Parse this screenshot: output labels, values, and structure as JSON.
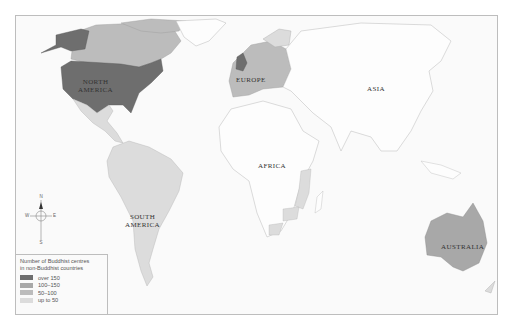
{
  "map": {
    "title": "Number of Buddhist centres in non-Buddhist countries",
    "regions": [
      {
        "name": "NORTH AMERICA",
        "label_lines": [
          "NORTH",
          "AMERICA"
        ]
      },
      {
        "name": "EUROPE",
        "label_lines": [
          "EUROPE"
        ]
      },
      {
        "name": "ASIA",
        "label_lines": [
          "ASIA"
        ]
      },
      {
        "name": "AFRICA",
        "label_lines": [
          "AFRICA"
        ]
      },
      {
        "name": "SOUTH AMERICA",
        "label_lines": [
          "SOUTH",
          "AMERICA"
        ]
      },
      {
        "name": "AUSTRALIA",
        "label_lines": [
          "AUSTRALIA"
        ]
      }
    ],
    "compass": {
      "n": "N",
      "s": "S",
      "e": "E",
      "w": "W"
    }
  },
  "legend": {
    "title_line1": "Number of Buddhist centres",
    "title_line2": "in non-Buddhist countries",
    "items": [
      {
        "label": "over 150",
        "color": "#6e6e6e"
      },
      {
        "label": "100–150",
        "color": "#a8a8a8"
      },
      {
        "label": "50–100",
        "color": "#bcbcbc"
      },
      {
        "label": "up to 50",
        "color": "#dcdcdc"
      }
    ]
  },
  "colors": {
    "land_none": "#fdfdfd",
    "coast": "#b8b8b8",
    "frame": "#bdbdbd"
  }
}
